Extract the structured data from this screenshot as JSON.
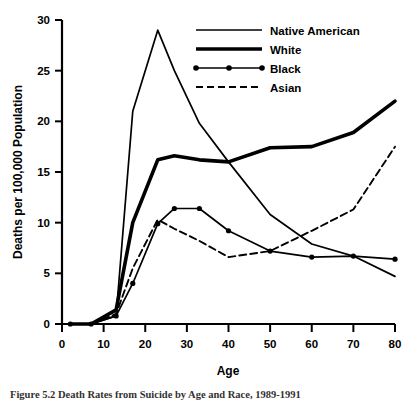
{
  "figure": {
    "caption": "Figure 5.2   Death Rates from Suicide by Age and Race, 1989-1991",
    "background_color": "#ffffff",
    "line_color": "#000000"
  },
  "chart_data": {
    "type": "line",
    "title": "",
    "subtitle": "",
    "xlabel": "Age",
    "ylabel": "Deaths per 100,000 Population",
    "xlim": [
      0,
      80
    ],
    "ylim": [
      0,
      30
    ],
    "xticks": [
      0,
      10,
      20,
      30,
      40,
      50,
      60,
      70,
      80
    ],
    "yticks": [
      0,
      5,
      10,
      15,
      20,
      25,
      30
    ],
    "xtick_labels": [
      "0",
      "10",
      "20",
      "30",
      "40",
      "50",
      "60",
      "70",
      "80"
    ],
    "ytick_labels": [
      "0",
      "5",
      "10",
      "15",
      "20",
      "25",
      "30"
    ],
    "grid": false,
    "legend_position": "top-right",
    "series": [
      {
        "name": "Native American",
        "style": "thin-solid",
        "markers": false,
        "x": [
          2,
          7,
          13,
          17,
          23,
          27,
          33,
          40,
          50,
          60,
          70,
          80
        ],
        "y": [
          0.0,
          0.0,
          0.8,
          21.0,
          29.0,
          25.0,
          19.8,
          16.0,
          10.8,
          7.9,
          6.7,
          4.7
        ]
      },
      {
        "name": "White",
        "style": "thick-solid",
        "markers": false,
        "x": [
          2,
          7,
          13,
          17,
          23,
          27,
          33,
          40,
          50,
          60,
          70,
          80
        ],
        "y": [
          0.0,
          0.0,
          1.4,
          10.0,
          16.2,
          16.6,
          16.2,
          16.0,
          17.4,
          17.5,
          18.9,
          22.0
        ]
      },
      {
        "name": "Black",
        "style": "thin-solid",
        "markers": true,
        "x": [
          2,
          7,
          13,
          17,
          23,
          27,
          33,
          40,
          50,
          60,
          70,
          80
        ],
        "y": [
          0.0,
          0.0,
          0.8,
          4.0,
          9.9,
          11.4,
          11.4,
          9.2,
          7.2,
          6.6,
          6.7,
          6.4
        ]
      },
      {
        "name": "Asian",
        "style": "dashed",
        "markers": false,
        "x": [
          2,
          7,
          13,
          17,
          23,
          27,
          33,
          40,
          50,
          60,
          70,
          80
        ],
        "y": [
          0.0,
          0.0,
          1.0,
          5.5,
          10.3,
          9.4,
          8.2,
          6.6,
          7.2,
          9.2,
          11.3,
          17.5
        ]
      }
    ]
  },
  "legend": {
    "items": [
      {
        "label": "Native American",
        "style": "thin-solid"
      },
      {
        "label": "White",
        "style": "thick-solid"
      },
      {
        "label": "Black",
        "style": "dotted-markers"
      },
      {
        "label": "Asian",
        "style": "dashed"
      }
    ]
  }
}
